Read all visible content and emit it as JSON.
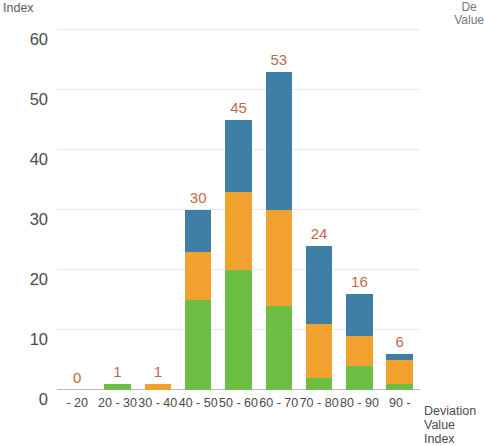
{
  "captions": {
    "y_axis_title": "Index",
    "top_right": "De\nValue",
    "x_axis_title": "Deviation\nValue Index"
  },
  "colors": {
    "green": "#6cbe45",
    "orange": "#f0a12e",
    "blue": "#3f7fa6",
    "label": "#c06a4b",
    "axis_text": "#4a4a4a",
    "gridline": "#e9e9e9"
  },
  "chart_data": {
    "type": "bar",
    "title": "",
    "subtitle": "",
    "xlabel": "Deviation Value Index",
    "ylabel": "Index",
    "stacked": true,
    "grid": true,
    "legend_position": "none",
    "ylim": [
      0,
      60
    ],
    "yticks": [
      60,
      50,
      40,
      30,
      20,
      10,
      0
    ],
    "categories": [
      "- 20",
      "20 - 30",
      "30 - 40",
      "40 - 50",
      "50 - 60",
      "60 - 70",
      "70 - 80",
      "80 - 90",
      "90 -"
    ],
    "totals": [
      0,
      1,
      1,
      30,
      45,
      53,
      24,
      16,
      6
    ],
    "data_labels": [
      "0",
      "1",
      "1",
      "30",
      "45",
      "53",
      "24",
      "16",
      "6"
    ],
    "series": [
      {
        "name": "green",
        "color": "#6cbe45",
        "values": [
          0,
          1,
          0,
          15,
          20,
          14,
          2,
          4,
          1
        ]
      },
      {
        "name": "orange",
        "color": "#f0a12e",
        "values": [
          0,
          0,
          1,
          8,
          13,
          16,
          9,
          5,
          4
        ]
      },
      {
        "name": "blue",
        "color": "#3f7fa6",
        "values": [
          0,
          0,
          0,
          7,
          12,
          23,
          13,
          7,
          1
        ]
      }
    ]
  }
}
